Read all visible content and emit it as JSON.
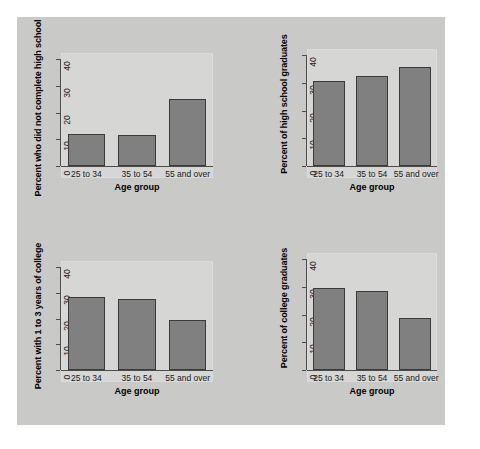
{
  "figure": {
    "background_color": "#c9c9c7",
    "plot_background_color": "#d6d6d4",
    "bar_color": "#808080",
    "bar_edge_color": "#3a3a3a",
    "axis_color": "#4b4b4b"
  },
  "chart_data": [
    {
      "id": "panel-tl",
      "type": "bar",
      "title": "",
      "categories": [
        "25 to 34",
        "35 to 54",
        "55 and over"
      ],
      "values": [
        11.8,
        11.6,
        25.1
      ],
      "xlabel": "Age group",
      "ylabel": "Percent who did not complete high school",
      "ylim": [
        0,
        40
      ],
      "yticks": [
        0,
        10,
        20,
        30,
        40
      ],
      "ytick_labels": [
        "0",
        "10",
        "20",
        "30",
        "40"
      ],
      "grid": false,
      "legend": "none"
    },
    {
      "id": "panel-tr",
      "type": "bar",
      "title": "",
      "categories": [
        "25 to 34",
        "35 to 54",
        "55 and over"
      ],
      "values": [
        30.7,
        32.5,
        35.5
      ],
      "xlabel": "Age group",
      "ylabel": "Percent of high school graduates",
      "ylim": [
        0,
        40
      ],
      "yticks": [
        0,
        10,
        20,
        30,
        40
      ],
      "ytick_labels": [
        "0",
        "10",
        "20",
        "30",
        "40"
      ],
      "grid": false,
      "legend": "none"
    },
    {
      "id": "panel-bl",
      "type": "bar",
      "title": "",
      "categories": [
        "25 to 34",
        "35 to 54",
        "55 and over"
      ],
      "values": [
        28.2,
        27.7,
        19.5
      ],
      "xlabel": "Age group",
      "ylabel": "Percent with 1 to 3 years of college",
      "ylim": [
        0,
        40
      ],
      "yticks": [
        0,
        10,
        20,
        30,
        40
      ],
      "ytick_labels": [
        "0",
        "10",
        "20",
        "30",
        "40"
      ],
      "grid": false,
      "legend": "none"
    },
    {
      "id": "panel-br",
      "type": "bar",
      "title": "",
      "categories": [
        "25 to 34",
        "35 to 54",
        "55 and over"
      ],
      "values": [
        29.5,
        28.4,
        18.9
      ],
      "xlabel": "Age group",
      "ylabel": "Percent of college graduates",
      "ylim": [
        0,
        40
      ],
      "yticks": [
        0,
        10,
        20,
        30,
        40
      ],
      "ytick_labels": [
        "0",
        "10",
        "20",
        "30",
        "40"
      ],
      "grid": false,
      "legend": "none"
    }
  ]
}
